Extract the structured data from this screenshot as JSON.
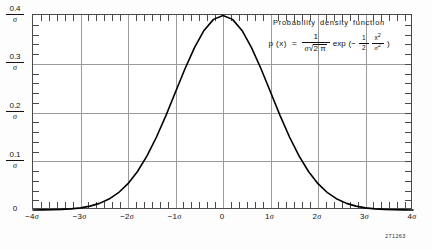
{
  "chart_data": {
    "type": "line",
    "title": "Probability density function",
    "formula_plain": "p (x) = 1 / (σ √(2π)) exp(-1/2 · x²/σ²)",
    "formula_parts": {
      "lhs": "p (x)",
      "equals": "=",
      "frac_numerator": "1",
      "frac_denominator_sigma": "σ",
      "radical": "√",
      "radicand": "2 π",
      "exp": "exp",
      "paren_open": "(−",
      "half_num": "1",
      "half_den": "2",
      "x_sq_num": "x",
      "x_sq_num_sup": "2",
      "x_sq_den": "σ",
      "x_sq_den_sup": "2",
      "paren_close": ")"
    },
    "xlabel": "",
    "ylabel": "",
    "xlim": [
      -4,
      4
    ],
    "ylim": [
      0,
      0.4
    ],
    "grid": true,
    "legend": false,
    "x_ticks": [
      {
        "value": -4,
        "label": "−4",
        "unit": "σ"
      },
      {
        "value": -3,
        "label": "−3",
        "unit": "σ"
      },
      {
        "value": -2,
        "label": "−2",
        "unit": "σ"
      },
      {
        "value": -1,
        "label": "−1",
        "unit": "σ"
      },
      {
        "value": 0,
        "label": "0",
        "unit": ""
      },
      {
        "value": 1,
        "label": "1",
        "unit": "σ"
      },
      {
        "value": 2,
        "label": "2",
        "unit": "σ"
      },
      {
        "value": 3,
        "label": "3",
        "unit": "σ"
      },
      {
        "value": 4,
        "label": "4",
        "unit": "σ"
      }
    ],
    "y_ticks": [
      {
        "value": 0.4,
        "numerator": "0.4",
        "denominator": "σ"
      },
      {
        "value": 0.3,
        "numerator": "0.3",
        "denominator": "σ"
      },
      {
        "value": 0.2,
        "numerator": "0.2",
        "denominator": "σ"
      },
      {
        "value": 0.1,
        "numerator": "0.1",
        "denominator": "σ"
      },
      {
        "value": 0,
        "numerator": "0",
        "denominator": ""
      }
    ],
    "minor_ticks_per_interval": 5,
    "x": [
      -4.0,
      -3.8,
      -3.6,
      -3.4,
      -3.2,
      -3.0,
      -2.8,
      -2.6,
      -2.4,
      -2.2,
      -2.0,
      -1.8,
      -1.6,
      -1.4,
      -1.2,
      -1.0,
      -0.8,
      -0.6,
      -0.4,
      -0.2,
      0.0,
      0.2,
      0.4,
      0.6,
      0.8,
      1.0,
      1.2,
      1.4,
      1.6,
      1.8,
      2.0,
      2.2,
      2.4,
      2.6,
      2.8,
      3.0,
      3.2,
      3.4,
      3.6,
      3.8,
      4.0
    ],
    "values": [
      0.0001338,
      0.0002919,
      0.0006119,
      0.0012322,
      0.0023841,
      0.0044318,
      0.0079155,
      0.013583,
      0.0223945,
      0.0354746,
      0.053991,
      0.0789502,
      0.1109208,
      0.1497275,
      0.1941861,
      0.2419707,
      0.2896916,
      0.3332246,
      0.3682701,
      0.3910427,
      0.3989423,
      0.3910427,
      0.3682701,
      0.3332246,
      0.2896916,
      0.2419707,
      0.1941861,
      0.1497275,
      0.1109208,
      0.0789502,
      0.053991,
      0.0354746,
      0.0223945,
      0.013583,
      0.0079155,
      0.0044318,
      0.0023841,
      0.0012322,
      0.0006119,
      0.0002919,
      0.0001338
    ],
    "peak": {
      "x": 0,
      "y": 0.3989423
    },
    "curve_color": "#000000",
    "grid_color": "#9a9a9a",
    "frame_color": "#4a4a4a"
  },
  "plate": {
    "number": "271263"
  }
}
